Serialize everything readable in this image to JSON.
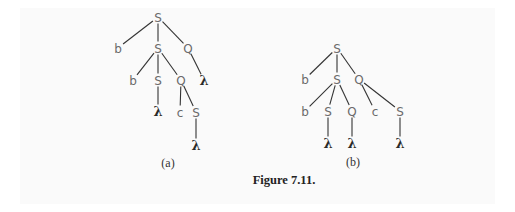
{
  "figure": {
    "caption": "Figure 7.11.",
    "trees": [
      {
        "id": "a",
        "label": "(a)",
        "label_pos": [
          168,
          163
        ],
        "nodes": [
          {
            "id": "a0",
            "symbol": "S",
            "x": 158,
            "y": 17
          },
          {
            "id": "a1",
            "symbol": "b",
            "x": 118,
            "y": 48
          },
          {
            "id": "a2",
            "symbol": "S",
            "x": 158,
            "y": 48
          },
          {
            "id": "a3",
            "symbol": "Q",
            "x": 188,
            "y": 48
          },
          {
            "id": "a4",
            "symbol": "b",
            "x": 133,
            "y": 80
          },
          {
            "id": "a5",
            "symbol": "S",
            "x": 158,
            "y": 80
          },
          {
            "id": "a6",
            "symbol": "Q",
            "x": 181,
            "y": 80
          },
          {
            "id": "a7",
            "symbol": "λ",
            "x": 204,
            "y": 80
          },
          {
            "id": "a8",
            "symbol": "λ",
            "x": 158,
            "y": 111
          },
          {
            "id": "a9",
            "symbol": "c",
            "x": 180,
            "y": 112
          },
          {
            "id": "a10",
            "symbol": "S",
            "x": 196,
            "y": 112
          },
          {
            "id": "a11",
            "symbol": "λ",
            "x": 196,
            "y": 145
          }
        ],
        "edges": [
          [
            "a0",
            "a1"
          ],
          [
            "a0",
            "a2"
          ],
          [
            "a0",
            "a3"
          ],
          [
            "a2",
            "a4"
          ],
          [
            "a2",
            "a5"
          ],
          [
            "a2",
            "a6"
          ],
          [
            "a3",
            "a7"
          ],
          [
            "a5",
            "a8"
          ],
          [
            "a6",
            "a9"
          ],
          [
            "a6",
            "a10"
          ],
          [
            "a10",
            "a11"
          ]
        ]
      },
      {
        "id": "b",
        "label": "(b)",
        "label_pos": [
          353,
          162
        ],
        "nodes": [
          {
            "id": "b0",
            "symbol": "S",
            "x": 337,
            "y": 48
          },
          {
            "id": "b1",
            "symbol": "b",
            "x": 305,
            "y": 79
          },
          {
            "id": "b2",
            "symbol": "S",
            "x": 337,
            "y": 79
          },
          {
            "id": "b3",
            "symbol": "Q",
            "x": 359,
            "y": 79
          },
          {
            "id": "b4",
            "symbol": "b",
            "x": 305,
            "y": 111
          },
          {
            "id": "b5",
            "symbol": "S",
            "x": 328,
            "y": 111
          },
          {
            "id": "b6",
            "symbol": "Q",
            "x": 352,
            "y": 111
          },
          {
            "id": "b7",
            "symbol": "c",
            "x": 375,
            "y": 111
          },
          {
            "id": "b8",
            "symbol": "S",
            "x": 400,
            "y": 111
          },
          {
            "id": "b9",
            "symbol": "λ",
            "x": 328,
            "y": 143
          },
          {
            "id": "b10",
            "symbol": "λ",
            "x": 352,
            "y": 143
          },
          {
            "id": "b11",
            "symbol": "λ",
            "x": 400,
            "y": 143
          }
        ],
        "edges": [
          [
            "b0",
            "b1"
          ],
          [
            "b0",
            "b2"
          ],
          [
            "b0",
            "b3"
          ],
          [
            "b2",
            "b4"
          ],
          [
            "b2",
            "b5"
          ],
          [
            "b2",
            "b6"
          ],
          [
            "b3",
            "b7"
          ],
          [
            "b3",
            "b8"
          ],
          [
            "b5",
            "b9"
          ],
          [
            "b6",
            "b10"
          ],
          [
            "b8",
            "b11"
          ]
        ]
      }
    ],
    "caption_pos": [
      284,
      184
    ]
  }
}
